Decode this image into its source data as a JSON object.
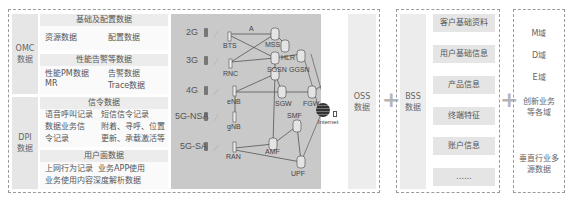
{
  "left_panel": {
    "omc": {
      "label": "OMC\n数据",
      "basic_config": {
        "title": "基础及配置数据",
        "items": [
          "资源数据",
          "配置数据"
        ]
      },
      "performance_alarm": {
        "title": "性能告警等数据",
        "items": [
          "性能PM数据",
          "告警数据",
          "MR",
          "Trace数据"
        ]
      }
    },
    "dpi": {
      "label": "DPI\n数据",
      "signaling": {
        "title": "信令数据",
        "items": [
          "语音呼叫记录",
          "短信信令记录",
          "数据业务信",
          "附着、寻呼、位置",
          "令记录",
          "更新、承载激活等"
        ]
      },
      "user_plane": {
        "title": "用户面数据",
        "items": [
          "上网行为记录  业务APP使用",
          "业务使用内容深度解析数据"
        ]
      }
    }
  },
  "network": {
    "generations": [
      "2G",
      "3G",
      "4G",
      "5G-NSA",
      "5G-SA"
    ],
    "nodes": [
      "BTS",
      "RNC",
      "eNB",
      "gNB",
      "RAN",
      "MSS",
      "HLR",
      "SGSN",
      "GGSN",
      "SGW",
      "FGW",
      "SMF",
      "AMF",
      "UPF",
      "Internet"
    ],
    "link_label": "A"
  },
  "oss": {
    "label": "OSS\n数据"
  },
  "bss": {
    "label": "BSS\n数据",
    "items": [
      "客户基础资料",
      "用户基础信息",
      "产品信息",
      "终端特征",
      "账户信息",
      "......"
    ]
  },
  "domains": {
    "items": [
      "M域",
      "D域",
      "E域",
      "创新业务\n等各域",
      "垂直行业多\n源数据"
    ]
  },
  "symbols": {
    "plus": "+"
  },
  "colors": {
    "network_bg": "#c9c9c9",
    "label_bg": "#e6e6e6",
    "subtitle_bg": "#ececec",
    "dash_border": "#9a9a9a",
    "plus": "#b5b5b5"
  }
}
